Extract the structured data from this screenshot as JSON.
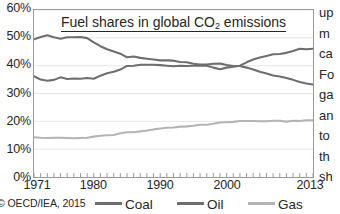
{
  "chart_data": {
    "type": "line",
    "title": "Fuel shares in global CO2 emissions",
    "title_prefix": "Fuel shares in global CO",
    "title_sub": "2",
    "title_suffix": " emissions",
    "xlabel": "",
    "ylabel": "",
    "xlim": [
      1971,
      2013
    ],
    "ylim": [
      0,
      60
    ],
    "grid": true,
    "legend_position": "bottom",
    "x_tick_labels": [
      "1971",
      "1980",
      "1990",
      "2000",
      "2013"
    ],
    "x_tick_values": [
      1971,
      1980,
      1990,
      2000,
      2013
    ],
    "y_tick_labels": [
      "60%",
      "50%",
      "40%",
      "30%",
      "20%",
      "10%",
      "0%"
    ],
    "y_tick_values": [
      60,
      50,
      40,
      30,
      20,
      10,
      0
    ],
    "x": [
      1971,
      1972,
      1973,
      1974,
      1975,
      1976,
      1977,
      1978,
      1979,
      1980,
      1981,
      1982,
      1983,
      1984,
      1985,
      1986,
      1987,
      1988,
      1989,
      1990,
      1991,
      1992,
      1993,
      1994,
      1995,
      1996,
      1997,
      1998,
      1999,
      2000,
      2001,
      2002,
      2003,
      2004,
      2005,
      2006,
      2007,
      2008,
      2009,
      2010,
      2011,
      2012,
      2013
    ],
    "series": [
      {
        "name": "Coal",
        "color": "#6e6e6e",
        "values": [
          36.2,
          35.0,
          34.6,
          34.9,
          35.8,
          35.2,
          35.4,
          35.3,
          35.6,
          35.3,
          36.4,
          37.3,
          37.8,
          38.6,
          39.9,
          40.0,
          40.3,
          40.3,
          40.3,
          40.2,
          40.0,
          39.8,
          40.0,
          39.9,
          40.0,
          40.0,
          40.0,
          39.3,
          38.7,
          39.3,
          39.6,
          40.0,
          41.2,
          42.2,
          42.9,
          43.5,
          44.1,
          44.2,
          44.6,
          45.3,
          46.1,
          45.9,
          46.1
        ]
      },
      {
        "name": "Oil",
        "color": "#6e6e6e",
        "values": [
          49.5,
          50.3,
          50.9,
          50.2,
          49.7,
          50.2,
          50.2,
          50.3,
          49.9,
          48.4,
          47.0,
          45.9,
          45.1,
          44.3,
          43.0,
          43.3,
          42.8,
          42.5,
          42.2,
          41.9,
          41.9,
          41.8,
          41.3,
          41.2,
          40.7,
          40.4,
          40.4,
          40.7,
          40.8,
          40.2,
          39.9,
          39.9,
          39.3,
          38.6,
          37.8,
          37.2,
          36.5,
          36.1,
          35.6,
          34.9,
          34.1,
          33.6,
          33.2
        ]
      },
      {
        "name": "Gas",
        "color": "#b4b4b4",
        "values": [
          14.3,
          14.1,
          14.0,
          14.1,
          14.1,
          14.0,
          13.9,
          14.0,
          14.1,
          14.5,
          14.8,
          15.0,
          15.1,
          15.7,
          16.1,
          16.1,
          16.4,
          16.7,
          17.1,
          17.4,
          17.7,
          17.8,
          18.1,
          18.2,
          18.4,
          18.8,
          18.8,
          19.1,
          19.6,
          19.7,
          19.8,
          20.1,
          20.1,
          20.1,
          20.0,
          20.0,
          20.2,
          20.2,
          19.9,
          20.2,
          20.1,
          20.4,
          20.4
        ]
      }
    ]
  },
  "chart": {
    "axis_border_color": "#9a9a9a",
    "gridline_color": "#e6e6e6"
  },
  "footer": {
    "copyright": "© OECD/IEA, 2015",
    "legend": [
      {
        "label": "Coal",
        "color": "#6e6e6e"
      },
      {
        "label": "Oil",
        "color": "#6e6e6e"
      },
      {
        "label": "Gas",
        "color": "#b4b4b4"
      }
    ]
  },
  "side_text": {
    "lines": [
      "up",
      "m",
      "ca",
      "Fo",
      "ga",
      "an",
      "to",
      "th",
      "sh"
    ]
  }
}
